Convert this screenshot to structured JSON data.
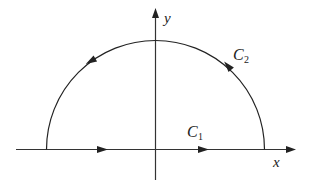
{
  "diagram": {
    "type": "contour-integral-semicircle",
    "axes": {
      "x_label": "x",
      "y_label": "y"
    },
    "contours": [
      {
        "name": "C",
        "subscript": "1",
        "description": "segment along real axis from -R to R, directed right"
      },
      {
        "name": "C",
        "subscript": "2",
        "description": "upper semicircle of radius R, directed counterclockwise"
      }
    ],
    "colors": {
      "stroke": "#222222",
      "background": "#ffffff"
    }
  }
}
